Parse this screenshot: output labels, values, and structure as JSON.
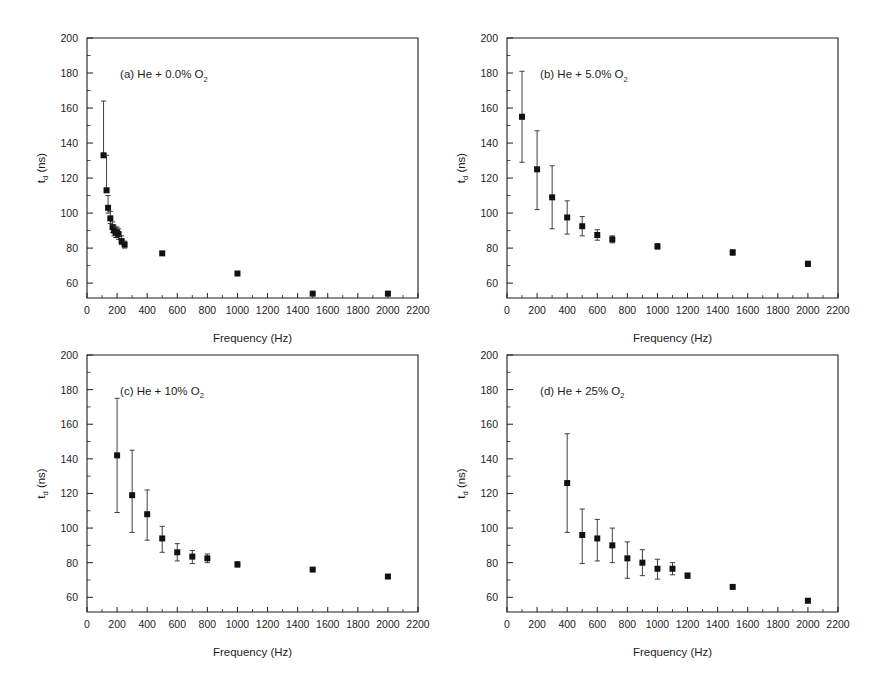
{
  "figure": {
    "background": "#ffffff",
    "marker_color": "#111111",
    "axis_color": "#1d1d1d",
    "xlabel": "Frequency (Hz)",
    "ylabel_main": "t",
    "ylabel_sub": "d",
    "ylabel_unit": " (ns)",
    "xticks": [
      0,
      200,
      400,
      600,
      800,
      1000,
      1200,
      1400,
      1600,
      1800,
      2000,
      2200
    ],
    "yticks": [
      60,
      80,
      100,
      120,
      140,
      160,
      180,
      200
    ],
    "xlim": [
      0,
      2200
    ],
    "ylim_axis": [
      51.5,
      200
    ],
    "ylim_labeled": [
      60,
      200
    ]
  },
  "chart_data": [
    {
      "type": "scatter",
      "id": "panel-a",
      "title": "(a) He + 0.0% O",
      "title_sub": "2",
      "xlabel": "Frequency (Hz)",
      "ylabel": "t_d (ns)",
      "xlim": [
        0,
        2200
      ],
      "ylim": [
        51.5,
        200
      ],
      "grid": false,
      "legend": "none",
      "x": [
        110,
        130,
        140,
        155,
        170,
        180,
        190,
        200,
        210,
        230,
        250,
        500,
        1000,
        1500,
        2000
      ],
      "y": [
        133,
        113,
        103,
        97,
        92,
        90,
        89,
        89,
        88,
        84,
        82,
        77,
        65.5,
        54,
        54
      ],
      "yerr_low": [
        133,
        113,
        100,
        94,
        89,
        87,
        86,
        86,
        85,
        82,
        80,
        0,
        0,
        0,
        0
      ],
      "yerr_high": [
        164,
        133,
        110,
        101,
        95,
        93,
        92,
        92,
        91,
        87,
        84,
        0,
        0,
        0,
        0
      ]
    },
    {
      "type": "scatter",
      "id": "panel-b",
      "title": "(b) He + 5.0% O",
      "title_sub": "2",
      "xlabel": "Frequency (Hz)",
      "ylabel": "t_d (ns)",
      "xlim": [
        0,
        2200
      ],
      "ylim": [
        51.5,
        200
      ],
      "grid": false,
      "legend": "none",
      "x": [
        100,
        200,
        300,
        400,
        500,
        600,
        700,
        1000,
        1500,
        2000
      ],
      "y": [
        155,
        125,
        109,
        97.5,
        92.5,
        87.5,
        85,
        81,
        77.5,
        71
      ],
      "yerr_low": [
        129,
        102,
        91,
        88,
        87,
        84.5,
        83,
        79.5,
        76,
        69.5
      ],
      "yerr_high": [
        181,
        147,
        127,
        107,
        98,
        90.5,
        87,
        82.5,
        79,
        72.5
      ]
    },
    {
      "type": "scatter",
      "id": "panel-c",
      "title": "(c) He + 10% O",
      "title_sub": "2",
      "xlabel": "Frequency (Hz)",
      "ylabel": "t_d (ns)",
      "xlim": [
        0,
        2200
      ],
      "ylim": [
        51.5,
        200
      ],
      "grid": false,
      "legend": "none",
      "x": [
        200,
        300,
        400,
        500,
        600,
        700,
        800,
        1000,
        1500,
        2000
      ],
      "y": [
        142,
        119,
        108,
        94,
        86,
        83.5,
        82.5,
        79,
        76,
        72
      ],
      "yerr_low": [
        109,
        97.5,
        93,
        86,
        81,
        79.5,
        80,
        77.5,
        75,
        71
      ],
      "yerr_high": [
        175,
        145,
        122,
        101,
        91,
        87,
        85,
        80.5,
        77,
        73
      ]
    },
    {
      "type": "scatter",
      "id": "panel-d",
      "title": "(d) He + 25% O",
      "title_sub": "2",
      "xlabel": "Frequency (Hz)",
      "ylabel": "t_d (ns)",
      "xlim": [
        0,
        2200
      ],
      "ylim": [
        51.5,
        200
      ],
      "grid": false,
      "legend": "none",
      "x": [
        400,
        500,
        600,
        700,
        800,
        900,
        1000,
        1100,
        1200,
        1500,
        2000
      ],
      "y": [
        126,
        96,
        94,
        90,
        82.5,
        80,
        76.5,
        76.5,
        72.5,
        66,
        58
      ],
      "yerr_low": [
        97.5,
        79.5,
        81,
        80,
        71,
        72.5,
        70.5,
        73,
        71,
        65,
        57
      ],
      "yerr_high": [
        154.5,
        111,
        105,
        100,
        92,
        87.5,
        82,
        80,
        74,
        67,
        59
      ]
    }
  ]
}
